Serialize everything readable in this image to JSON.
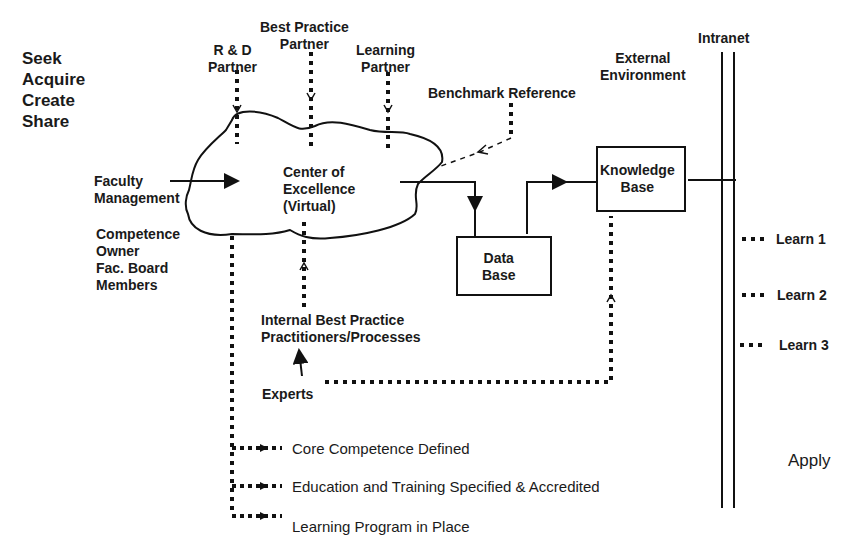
{
  "left_verbs": [
    "Seek",
    "Acquire",
    "Create",
    "Share"
  ],
  "partners": {
    "rd": [
      "R & D",
      "Partner"
    ],
    "best_practice": [
      "Best Practice",
      "Partner"
    ],
    "learning": [
      "Learning",
      "Partner"
    ]
  },
  "benchmark": "Benchmark Reference",
  "external_environment": [
    "External",
    "Environment"
  ],
  "intranet": "Intranet",
  "center": [
    "Center of",
    "Excellence",
    "(Virtual)"
  ],
  "faculty_management": [
    "Faculty",
    "Management"
  ],
  "competence_owner": [
    "Competence",
    "Owner",
    "Fac. Board",
    "Members"
  ],
  "data_base": [
    "Data",
    "Base"
  ],
  "knowledge_base": [
    "Knowledge",
    "Base"
  ],
  "internal_best_practice": [
    "Internal Best Practice",
    "Practitioners/Processes"
  ],
  "experts": "Experts",
  "learn_items": [
    "Learn 1",
    "Learn 2",
    "Learn 3"
  ],
  "apply": "Apply",
  "outcomes": [
    "Core Competence Defined",
    "Education and Training Specified & Accredited",
    "Learning Program in Place"
  ]
}
